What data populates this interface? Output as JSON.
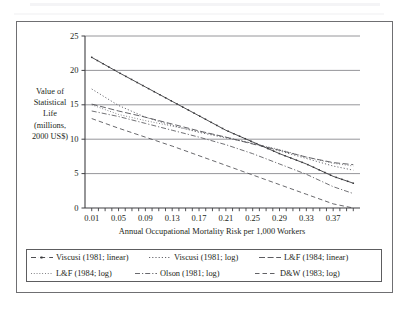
{
  "chart_data": {
    "type": "line",
    "title": "",
    "xlabel": "Annual Occupational Mortality Risk per 1,000 Workers",
    "ylabel": "Value of Statistical Life (millions, 2000 US$)",
    "ylabel_lines": [
      "Value of",
      "Statistical",
      "Life",
      "(millions,",
      "2000 US$)"
    ],
    "xlim": [
      0.0,
      0.41
    ],
    "ylim": [
      0,
      25
    ],
    "x_tick_labels": [
      "0.01",
      "0.05",
      "0.09",
      "0.13",
      "0.17",
      "0.21",
      "0.25",
      "0.29",
      "0.33",
      "0.37"
    ],
    "x_tick_values": [
      0.01,
      0.05,
      0.09,
      0.13,
      0.17,
      0.21,
      0.25,
      0.29,
      0.33,
      0.37
    ],
    "x_minor_tick_step": 0.01,
    "y_tick_labels": [
      "0",
      "5",
      "10",
      "15",
      "20",
      "25"
    ],
    "y_tick_values": [
      0,
      5,
      10,
      15,
      20,
      25
    ],
    "grid": "horizontal",
    "legend_position": "bottom",
    "series": [
      {
        "name": "Viscusi (1981; linear)",
        "style": "dash-dot-marker",
        "color": "#3a3a3d",
        "x": [
          0.01,
          0.05,
          0.09,
          0.13,
          0.17,
          0.21,
          0.25,
          0.29,
          0.33,
          0.37,
          0.4
        ],
        "values": [
          21.9,
          19.7,
          17.6,
          15.5,
          13.4,
          11.3,
          9.6,
          7.9,
          6.4,
          4.6,
          3.6
        ]
      },
      {
        "name": "Viscusi (1981; log)",
        "style": "dotted",
        "color": "#53535a",
        "x": [
          0.01,
          0.05,
          0.09,
          0.13,
          0.17,
          0.21,
          0.25,
          0.29,
          0.33,
          0.37,
          0.4
        ],
        "values": [
          17.3,
          14.9,
          13.2,
          12.0,
          11.0,
          10.2,
          9.4,
          8.3,
          7.2,
          6.1,
          5.5
        ]
      },
      {
        "name": "L&F (1984; linear)",
        "style": "long-dash",
        "color": "#4a4a4f",
        "x": [
          0.01,
          0.05,
          0.09,
          0.13,
          0.17,
          0.21,
          0.25,
          0.29,
          0.33,
          0.37,
          0.4
        ],
        "values": [
          15.1,
          14.1,
          13.2,
          12.2,
          11.2,
          10.3,
          9.3,
          8.4,
          7.4,
          6.6,
          6.3
        ]
      },
      {
        "name": "L&F (1984; log)",
        "style": "fine-dotted",
        "color": "#646469",
        "x": [
          0.01,
          0.05,
          0.09,
          0.13,
          0.17,
          0.21,
          0.25,
          0.29,
          0.33,
          0.37,
          0.4
        ],
        "values": [
          15.0,
          13.6,
          12.7,
          11.9,
          11.1,
          10.3,
          9.4,
          8.5,
          7.4,
          6.5,
          6.1
        ]
      },
      {
        "name": "Olson (1981; log)",
        "style": "dash-dot",
        "color": "#58585d",
        "x": [
          0.01,
          0.05,
          0.09,
          0.13,
          0.17,
          0.21,
          0.25,
          0.29,
          0.33,
          0.37,
          0.4
        ],
        "values": [
          14.1,
          13.3,
          12.3,
          11.3,
          10.3,
          9.2,
          7.9,
          6.4,
          4.9,
          3.1,
          2.1
        ]
      },
      {
        "name": "D&W (1983; log)",
        "style": "dashed",
        "color": "#4f4f54",
        "x": [
          0.01,
          0.05,
          0.09,
          0.13,
          0.17,
          0.21,
          0.25,
          0.29,
          0.33,
          0.37,
          0.4
        ],
        "values": [
          13.0,
          11.6,
          10.3,
          9.0,
          7.6,
          6.2,
          4.8,
          3.4,
          2.0,
          0.6,
          0.0
        ]
      }
    ]
  },
  "legend": {
    "rows": [
      [
        {
          "label": "Viscusi (1981; linear)",
          "swatch": "legend-swatch-viscusi-linear"
        },
        {
          "label": "Viscusi (1981; log)",
          "swatch": "legend-swatch-viscusi-log"
        },
        {
          "label": "L&F (1984; linear)",
          "swatch": "legend-swatch-lf-linear"
        }
      ],
      [
        {
          "label": "L&F (1984; log)",
          "swatch": "legend-swatch-lf-log"
        },
        {
          "label": "Olson (1981; log)",
          "swatch": "legend-swatch-olson-log"
        },
        {
          "label": "D&W (1983; log)",
          "swatch": "legend-swatch-dw-log"
        }
      ]
    ]
  },
  "colors": {
    "frame": "#6f6f72",
    "axis": "#3f3f43",
    "gridline": "#8a8a8f",
    "text": "#231f20",
    "background": "#ffffff"
  }
}
